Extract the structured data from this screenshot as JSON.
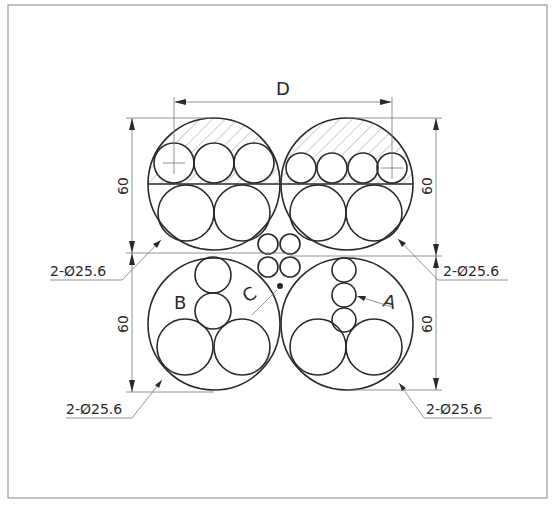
{
  "drawing": {
    "title_dimension": "D",
    "height_dims": [
      "60",
      "60",
      "60",
      "60"
    ],
    "callouts": {
      "top_left": "2-Ø25.6",
      "top_right": "2-Ø25.6",
      "bottom_left": "2-Ø25.6",
      "bottom_right": "2-Ø25.6"
    },
    "section_labels": {
      "a": "A",
      "b": "B",
      "c": "C"
    },
    "colors": {
      "line": "#2a2a2a",
      "thin": "#7a7a7a",
      "frame": "#9a9a9a"
    }
  }
}
